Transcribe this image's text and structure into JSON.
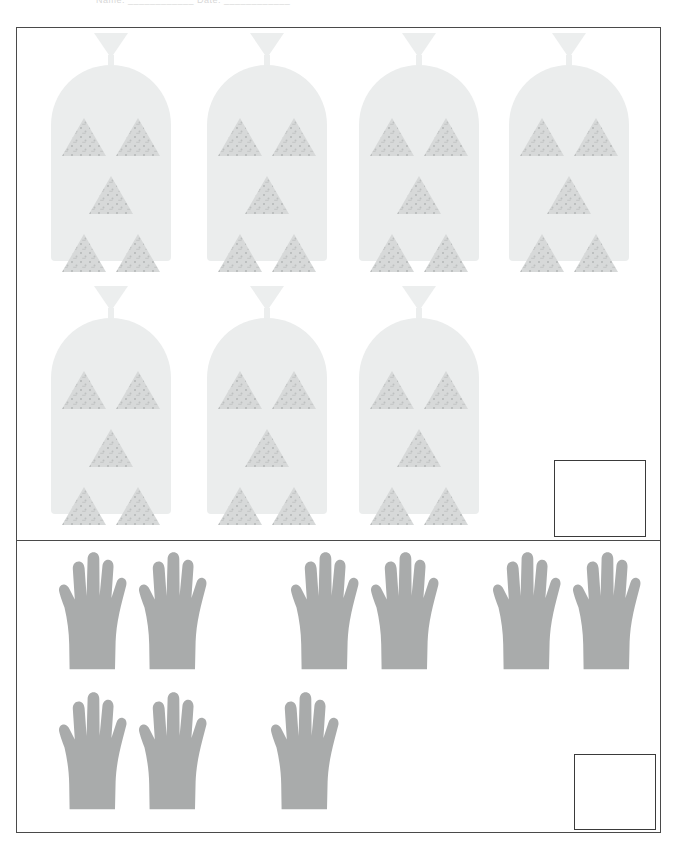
{
  "worksheet": {
    "header_text": "Name: ____________   Date: ____________",
    "page_width": 679,
    "page_height": 845
  },
  "colors": {
    "frame_border": "#4a4a4a",
    "answer_box_border": "#3a3a3a",
    "bag_fill": "#ebeded",
    "bag_tie_fill": "#eceeee",
    "chip_fill": "#d7d9d9",
    "chip_speckle": "#b9bcbc",
    "hand_fill": "#a9abab",
    "page_background": "#ffffff"
  },
  "sections": [
    {
      "id": "bags",
      "name": "bags-of-triangle-chips",
      "item_icon": "bag-icon",
      "unit_icon": "triangle-chip-icon",
      "items_per_unit": 5,
      "total_items": 7,
      "total_count": 35,
      "rows": [
        {
          "row_index": 0,
          "item_count": 4
        },
        {
          "row_index": 1,
          "item_count": 3
        }
      ],
      "answer_box": {
        "label": "",
        "value": "",
        "placeholder": ""
      }
    },
    {
      "id": "hands",
      "name": "hands-with-five-fingers",
      "item_icon": "hand-icon",
      "unit_icon": "finger-icon",
      "items_per_unit": 5,
      "total_items": 9,
      "total_count": 45,
      "rows": [
        {
          "row_index": 0,
          "item_count": 6
        },
        {
          "row_index": 1,
          "item_count": 3
        }
      ],
      "answer_box": {
        "label": "",
        "value": "",
        "placeholder": ""
      }
    }
  ]
}
